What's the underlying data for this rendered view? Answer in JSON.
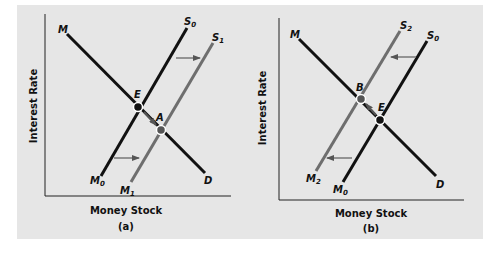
{
  "figure": {
    "background": "#ffffff",
    "panel_color": "#e6e6e6",
    "black_line": "#111111",
    "gray_line": "#6e6e6e",
    "arrow_color": "#777777"
  },
  "panels": [
    {
      "id": "a",
      "caption": "(a)",
      "ylabel": "Interest Rate",
      "xlabel": "Money Stock",
      "curves": [
        {
          "name": "demand",
          "start_label": "M",
          "end_label": "D"
        },
        {
          "name": "supply-0",
          "start_label": "M",
          "start_sub": "0",
          "end_label": "S",
          "end_sub": "0"
        },
        {
          "name": "supply-1",
          "start_label": "M",
          "start_sub": "1",
          "end_label": "S",
          "end_sub": "1"
        }
      ],
      "points": [
        {
          "label": "E",
          "type": "initial equilibrium"
        },
        {
          "label": "A",
          "type": "new equilibrium"
        }
      ],
      "shift_direction": "right"
    },
    {
      "id": "b",
      "caption": "(b)",
      "ylabel": "Interest Rate",
      "xlabel": "Money Stock",
      "curves": [
        {
          "name": "demand",
          "start_label": "M",
          "end_label": "D"
        },
        {
          "name": "supply-2",
          "start_label": "M",
          "start_sub": "2",
          "end_label": "S",
          "end_sub": "2"
        },
        {
          "name": "supply-0",
          "start_label": "M",
          "start_sub": "0",
          "end_label": "S",
          "end_sub": "0"
        }
      ],
      "points": [
        {
          "label": "B",
          "type": "new equilibrium"
        },
        {
          "label": "E",
          "type": "initial equilibrium"
        }
      ],
      "shift_direction": "left"
    }
  ]
}
